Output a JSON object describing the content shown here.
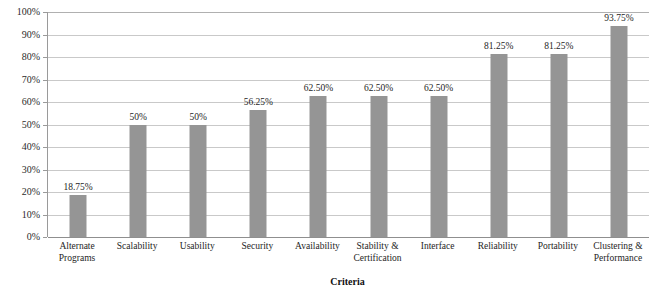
{
  "chart_data": {
    "type": "bar",
    "title": "",
    "xlabel": "Criteria",
    "ylabel": "",
    "ylim": [
      0,
      100
    ],
    "grid": true,
    "legend": "none",
    "orientation": "vertical",
    "bar_color": "#959595",
    "categories": [
      "Alternate Programs",
      "Scalability",
      "Usability",
      "Security",
      "Availability",
      "Stability & Certification",
      "Interface",
      "Reliability",
      "Portability",
      "Clustering & Performance"
    ],
    "category_lines": [
      [
        "Alternate",
        "Programs"
      ],
      [
        "Scalability"
      ],
      [
        "Usability"
      ],
      [
        "Security"
      ],
      [
        "Availability"
      ],
      [
        "Stability &",
        "Certification"
      ],
      [
        "Interface"
      ],
      [
        "Reliability"
      ],
      [
        "Portability"
      ],
      [
        "Clustering &",
        "Performance"
      ]
    ],
    "values": [
      18.75,
      50,
      50,
      56.25,
      62.5,
      62.5,
      62.5,
      81.25,
      81.25,
      93.75
    ],
    "value_labels": [
      "18.75%",
      "50%",
      "50%",
      "56.25%",
      "62.50%",
      "62.50%",
      "62.50%",
      "81.25%",
      "81.25%",
      "93.75%"
    ],
    "y_ticks": [
      0,
      10,
      20,
      30,
      40,
      50,
      60,
      70,
      80,
      90,
      100
    ],
    "y_tick_labels": [
      "0%",
      "10%",
      "20%",
      "30%",
      "40%",
      "50%",
      "60%",
      "70%",
      "80%",
      "90%",
      "100%"
    ]
  }
}
